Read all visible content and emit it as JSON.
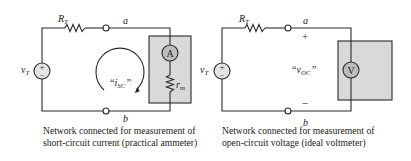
{
  "left_circuit": {
    "source_label": "v",
    "source_sub": "T",
    "resistor_label": "R",
    "resistor_sub": "T",
    "node_top": "a",
    "node_bottom": "b",
    "meter_symbol": "A",
    "meter_resistor_label": "r",
    "meter_resistor_sub": "m",
    "current_label_open": "“i",
    "current_label_sub": "SC",
    "current_label_close": "”",
    "caption_line1": "Network connected for measurement of",
    "caption_line2": "short-circuit current (practical ammeter)"
  },
  "right_circuit": {
    "source_label": "v",
    "source_sub": "T",
    "resistor_label": "R",
    "resistor_sub": "T",
    "node_top": "a",
    "node_bottom": "b",
    "plus": "+",
    "minus": "–",
    "meter_symbol": "V",
    "voltage_label_open": "“v",
    "voltage_label_sub": "OC",
    "voltage_label_close": "”",
    "caption_line1": "Network connected for measurement of",
    "caption_line2": "open-circuit voltage (ideal voltmeter)"
  },
  "colors": {
    "wire": "#2a2a2a",
    "meter_box": "#d9d9d9",
    "meter_fill": "#bdbdbd",
    "source_fill": "#e4e4e4"
  }
}
